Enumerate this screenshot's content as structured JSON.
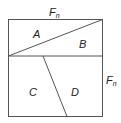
{
  "diagram": {
    "top_label": "F",
    "top_label_sub": "n",
    "side_label": "F",
    "side_label_sub": "n",
    "regions": [
      {
        "id": "A",
        "label": "A"
      },
      {
        "id": "B",
        "label": "B"
      },
      {
        "id": "C",
        "label": "C"
      },
      {
        "id": "D",
        "label": "D"
      }
    ],
    "line_color": "#555555"
  }
}
